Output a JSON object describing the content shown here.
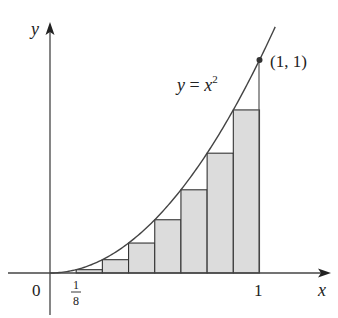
{
  "diagram": {
    "type": "riemann-sum-left-endpoints",
    "function_label": {
      "y": "y",
      "eq": " = ",
      "x": "x",
      "exp": "2"
    },
    "point_label": "(1, 1)",
    "axis_labels": {
      "x": "x",
      "y": "y"
    },
    "tick_labels": {
      "origin": "0",
      "one": "1",
      "frac_num": "1",
      "frac_den": "8"
    },
    "n_rectangles": 8,
    "colors": {
      "fill": "#dcdcdc",
      "stroke": "#333333",
      "curve": "#444444"
    }
  },
  "chart_data": {
    "type": "area",
    "title": "",
    "function": "y = x^2",
    "xlabel": "x",
    "ylabel": "y",
    "xlim": [
      0,
      1
    ],
    "ylim": [
      0,
      1
    ],
    "grid": false,
    "rectangles": {
      "method": "left endpoints",
      "n": 8,
      "width": 0.125,
      "x_left": [
        0,
        0.125,
        0.25,
        0.375,
        0.5,
        0.625,
        0.75,
        0.875
      ],
      "heights": [
        0,
        0.015625,
        0.0625,
        0.140625,
        0.25,
        0.390625,
        0.5625,
        0.765625
      ]
    },
    "annotations": [
      "(1, 1)",
      "y = x^2",
      "1/8",
      "0",
      "1"
    ]
  }
}
